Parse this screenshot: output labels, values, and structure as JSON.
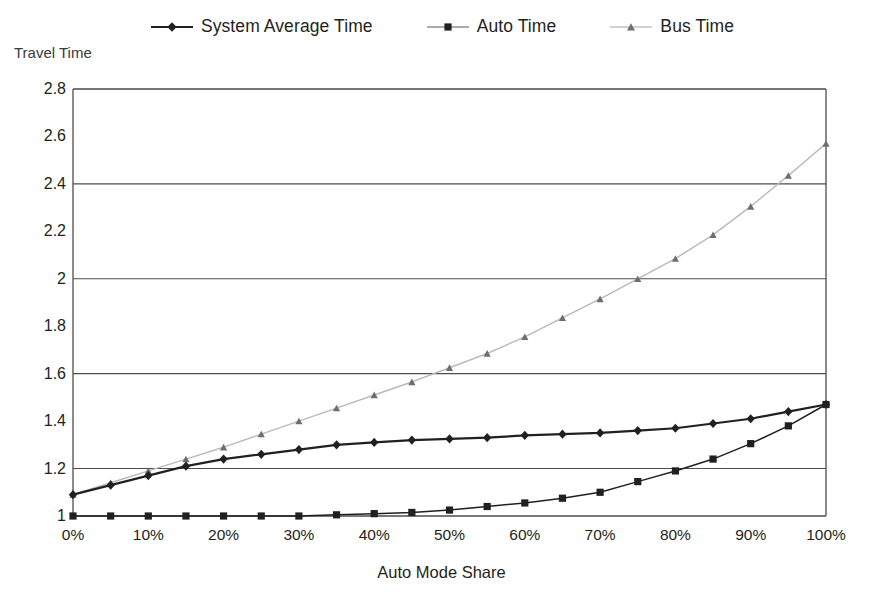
{
  "axis_titles": {
    "y": "Travel Time",
    "x": "Auto Mode Share"
  },
  "legend": {
    "items": [
      {
        "label": "System Average Time",
        "marker": "diamond",
        "color": "#231f20"
      },
      {
        "label": "Auto Time",
        "marker": "square",
        "color": "#231f20"
      },
      {
        "label": "Bus Time",
        "marker": "triangle",
        "color": "#b9b9b9"
      }
    ]
  },
  "ticks": {
    "y": [
      "2.8",
      "2.6",
      "2.4",
      "2.2",
      "2",
      "1.8",
      "1.6",
      "1.4",
      "1.2",
      "1"
    ],
    "x": [
      "0%",
      "10%",
      "20%",
      "30%",
      "40%",
      "50%",
      "60%",
      "70%",
      "80%",
      "90%",
      "100%"
    ]
  },
  "chart_data": {
    "type": "line",
    "title": "",
    "xlabel": "Auto Mode Share",
    "ylabel": "Travel Time",
    "xlim": [
      0,
      100
    ],
    "ylim": [
      1,
      2.8
    ],
    "grid": "horizontal",
    "gridlines_y": [
      1.2,
      1.6,
      2.0,
      2.4,
      2.8
    ],
    "legend_position": "top-center",
    "x": [
      0,
      5,
      10,
      15,
      20,
      25,
      30,
      35,
      40,
      45,
      50,
      55,
      60,
      65,
      70,
      75,
      80,
      85,
      90,
      95,
      100
    ],
    "series": [
      {
        "name": "System Average Time",
        "marker": "diamond",
        "color": "#231f20",
        "values": [
          1.09,
          1.13,
          1.17,
          1.21,
          1.24,
          1.26,
          1.28,
          1.3,
          1.31,
          1.32,
          1.325,
          1.33,
          1.34,
          1.345,
          1.35,
          1.36,
          1.37,
          1.39,
          1.41,
          1.44,
          1.47
        ]
      },
      {
        "name": "Auto Time",
        "marker": "square",
        "color": "#231f20",
        "values": [
          1.0,
          1.0,
          1.0,
          1.0,
          1.0,
          1.0,
          1.0,
          1.005,
          1.01,
          1.015,
          1.025,
          1.04,
          1.055,
          1.075,
          1.1,
          1.145,
          1.19,
          1.24,
          1.305,
          1.38,
          1.47
        ]
      },
      {
        "name": "Bus Time",
        "marker": "triangle",
        "color": "#b9b9b9",
        "values": [
          1.09,
          1.14,
          1.19,
          1.24,
          1.29,
          1.345,
          1.4,
          1.455,
          1.51,
          1.565,
          1.625,
          1.685,
          1.755,
          1.835,
          1.915,
          2.0,
          2.085,
          2.185,
          2.305,
          2.435,
          2.57
        ]
      }
    ]
  }
}
